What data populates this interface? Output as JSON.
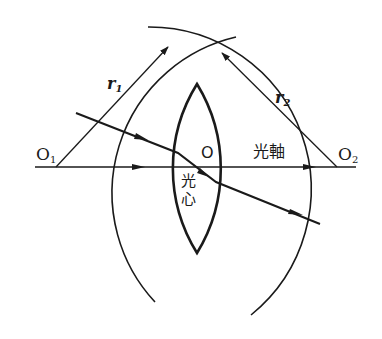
{
  "diagram": {
    "type": "optics-convex-lens",
    "colors": {
      "stroke": "#1a1a1a",
      "background": "#ffffff"
    },
    "labels": {
      "center_left": {
        "main": "O",
        "sub": "1"
      },
      "center_right": {
        "main": "O",
        "sub": "2"
      },
      "radius_left": {
        "main": "r",
        "sub": "1"
      },
      "radius_right": {
        "main": "r",
        "sub": "2"
      },
      "optical_center_point": "O",
      "optical_axis": "光軸",
      "optical_center_line1": "光",
      "optical_center_line2": "心"
    },
    "elements": {
      "optical_axis": {
        "from": [
          35,
          167
        ],
        "to": [
          356,
          167
        ]
      },
      "arc_left_surface": {
        "center": "O1",
        "radius": 162
      },
      "arc_right_surface": {
        "center": "O2",
        "radius": 160
      },
      "radius_arrow_1": {
        "from": "O1",
        "to": [
          168,
          47
        ]
      },
      "radius_arrow_2": {
        "from": "O2",
        "to": [
          222,
          53
        ]
      },
      "light_ray": {
        "points": [
          [
            76,
            113
          ],
          [
            178,
            153
          ],
          [
            216,
            182
          ],
          [
            320,
            224
          ]
        ]
      }
    }
  }
}
